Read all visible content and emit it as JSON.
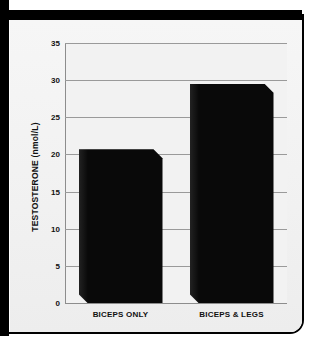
{
  "chart_data": {
    "type": "bar",
    "title": "",
    "xlabel": "",
    "ylabel": "TESTOSTERONE (nmol/L)",
    "categories": [
      "BICEPS ONLY",
      "BICEPS & LEGS"
    ],
    "values": [
      20.7,
      29.5
    ],
    "ylim": [
      0,
      35
    ],
    "ytick_step": 5,
    "yticks": [
      "0",
      "5",
      "10",
      "15",
      "20",
      "25",
      "30",
      "35"
    ],
    "ytick_values": [
      0,
      5,
      10,
      15,
      20,
      25,
      30,
      35
    ],
    "grid": true,
    "legend": false,
    "legend_position": "none",
    "series": [
      {
        "name": "Testosterone",
        "values": [
          20.7,
          29.5
        ]
      }
    ],
    "colors": {
      "bar": "#090909",
      "plot_background": "#f2f2f2",
      "gridline": "#9a9a9a",
      "axis": "#8d8d8d",
      "text": "#111111",
      "frame": "#000000"
    }
  }
}
